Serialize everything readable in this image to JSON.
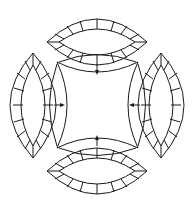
{
  "diagram": {
    "title": "",
    "colors": {
      "line": "#1a1a1a",
      "background": "#ffffff"
    },
    "center_piece": {
      "shape": "concave-square",
      "corners": [
        [
          57,
          62
        ],
        [
          138,
          62
        ],
        [
          138,
          148
        ],
        [
          57,
          148
        ]
      ]
    },
    "rings": [
      {
        "position": "top",
        "segments_per_band": 8,
        "tips": [
          [
            47,
            42
          ],
          [
            147,
            42
          ]
        ]
      },
      {
        "position": "right",
        "segments_per_band": 8,
        "tips": [
          [
            161,
            53
          ],
          [
            161,
            158
          ]
        ]
      },
      {
        "position": "bottom",
        "segments_per_band": 8,
        "tips": [
          [
            47,
            171
          ],
          [
            147,
            171
          ]
        ]
      },
      {
        "position": "left",
        "segments_per_band": 8,
        "tips": [
          [
            33,
            53
          ],
          [
            33,
            158
          ]
        ]
      }
    ],
    "arrows": [
      {
        "from": "top-ring",
        "to": "center",
        "direction": "down"
      },
      {
        "from": "right-ring",
        "to": "center",
        "direction": "left"
      },
      {
        "from": "bottom-ring",
        "to": "center",
        "direction": "up"
      },
      {
        "from": "left-ring",
        "to": "center",
        "direction": "right"
      }
    ]
  }
}
